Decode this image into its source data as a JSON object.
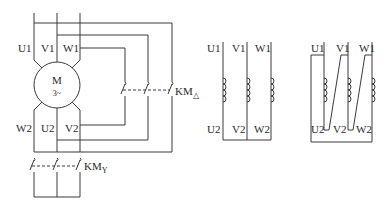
{
  "diagram": {
    "title": "",
    "motor": {
      "label": "M",
      "sublabel": "3~"
    },
    "top_terminals": [
      "U1",
      "V1",
      "W1"
    ],
    "bottom_terminals": [
      "W2",
      "U2",
      "V2"
    ],
    "delta_contactor": {
      "label": "KM",
      "subscript": "△"
    },
    "star_contactor": {
      "label": "KM",
      "subscript": "Y"
    },
    "star_connection": {
      "top": [
        "U1",
        "V1",
        "W1"
      ],
      "bottom": [
        "U2",
        "V2",
        "W2"
      ]
    },
    "delta_connection": {
      "top": [
        "U1",
        "V1",
        "W1"
      ],
      "bottom": [
        "U2",
        "V2",
        "W2"
      ]
    }
  }
}
